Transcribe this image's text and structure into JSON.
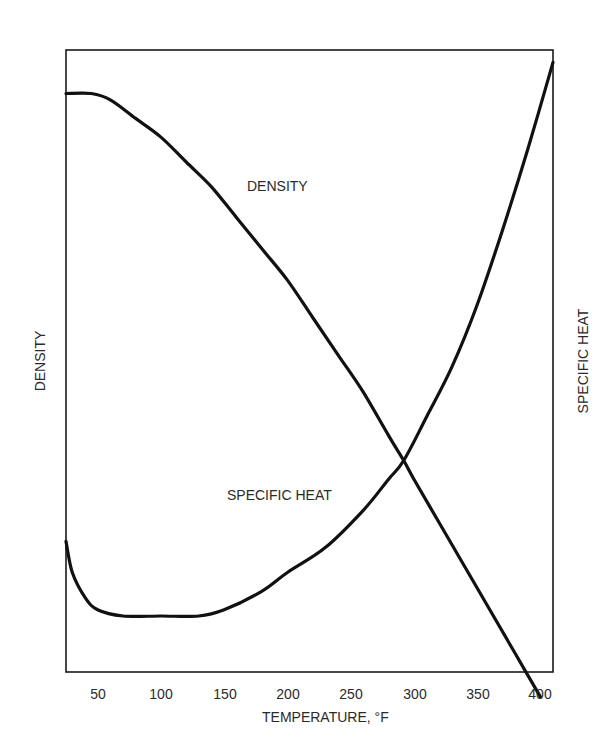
{
  "chart_data": {
    "type": "line",
    "title": "",
    "xlabel": "TEMPERATURE, °F",
    "ylabel": "DENSITY",
    "ylabel_right": "SPECIFIC HEAT",
    "x_ticks": [
      50,
      100,
      150,
      200,
      250,
      300,
      350,
      400
    ],
    "xlim": [
      25,
      410
    ],
    "ylim": [
      0,
      1
    ],
    "y_ticks": [],
    "grid": false,
    "legend": "none (curves labeled inline)",
    "series": [
      {
        "name": "DENSITY",
        "axis": "left",
        "label": "DENSITY",
        "x": [
          25,
          45,
          60,
          80,
          100,
          120,
          140,
          160,
          180,
          200,
          220,
          240,
          260,
          280,
          292,
          300,
          320,
          340,
          360,
          380,
          400
        ],
        "y": [
          0.93,
          0.93,
          0.92,
          0.89,
          0.86,
          0.82,
          0.78,
          0.73,
          0.68,
          0.63,
          0.57,
          0.51,
          0.45,
          0.38,
          0.34,
          0.31,
          0.24,
          0.17,
          0.1,
          0.03,
          -0.04
        ]
      },
      {
        "name": "SPECIFIC HEAT",
        "axis": "right",
        "label": "SPECIFIC HEAT",
        "x": [
          25,
          30,
          40,
          50,
          70,
          100,
          130,
          150,
          180,
          200,
          230,
          260,
          280,
          292,
          310,
          330,
          350,
          370,
          390,
          410
        ],
        "y": [
          0.21,
          0.16,
          0.12,
          0.1,
          0.09,
          0.09,
          0.09,
          0.1,
          0.13,
          0.16,
          0.2,
          0.26,
          0.31,
          0.34,
          0.41,
          0.49,
          0.59,
          0.71,
          0.84,
          0.98
        ]
      }
    ],
    "annotations": [
      {
        "text": "DENSITY",
        "near_x": 180,
        "on_series": "DENSITY"
      },
      {
        "text": "SPECIFIC HEAT",
        "near_x": 200,
        "on_series": "SPECIFIC HEAT"
      }
    ]
  },
  "labels": {
    "x_axis_title": "TEMPERATURE, °F",
    "left_axis_title": "DENSITY",
    "right_axis_title": "SPECIFIC HEAT",
    "density_curve_label": "DENSITY",
    "specific_heat_curve_label": "SPECIFIC HEAT",
    "x_ticks": [
      "50",
      "100",
      "150",
      "200",
      "250",
      "300",
      "350",
      "400"
    ]
  }
}
